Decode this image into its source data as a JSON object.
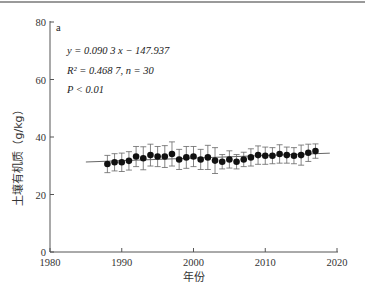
{
  "panel_label": "a",
  "annotations": {
    "equation": "y = 0.090 3 x − 147.937",
    "r2_line": "R² = 0.468 7, n = 30",
    "p_line": "P < 0.01"
  },
  "xlabel": "年份",
  "ylabel": "土壤有机质（g/kg）",
  "x_ticks": [
    "1980",
    "1990",
    "2000",
    "2010",
    "2020"
  ],
  "y_ticks": [
    "0",
    "20",
    "40",
    "60",
    "80"
  ],
  "chart_data": {
    "type": "scatter",
    "title": "",
    "panel": "a",
    "xlabel": "年份",
    "ylabel": "土壤有机质（g/kg）",
    "xlim": [
      1980,
      2020
    ],
    "ylim": [
      0,
      80
    ],
    "x_ticks": [
      1980,
      1990,
      2000,
      2010,
      2020
    ],
    "y_ticks": [
      0,
      20,
      40,
      60,
      80
    ],
    "grid": false,
    "legend": null,
    "series": [
      {
        "name": "土壤有机质",
        "marker": "filled-circle",
        "x": [
          1988,
          1989,
          1990,
          1991,
          1992,
          1993,
          1994,
          1995,
          1996,
          1997,
          1998,
          1999,
          2000,
          2001,
          2002,
          2003,
          2004,
          2005,
          2006,
          2007,
          2008,
          2009,
          2010,
          2011,
          2012,
          2013,
          2014,
          2015,
          2016,
          2017
        ],
        "y": [
          30.6,
          31.2,
          31.2,
          31.7,
          33.2,
          32.6,
          33.7,
          33.2,
          33.2,
          34.1,
          32.2,
          32.9,
          33.2,
          32.2,
          32.9,
          31.8,
          31.4,
          32.2,
          31.4,
          32.2,
          32.9,
          33.7,
          33.5,
          33.5,
          34.1,
          33.7,
          33.5,
          33.7,
          34.5,
          35.1
        ],
        "error": [
          3.0,
          3.0,
          3.2,
          3.2,
          3.5,
          4.0,
          3.8,
          3.5,
          3.8,
          4.2,
          3.5,
          3.8,
          3.5,
          3.5,
          4.2,
          4.5,
          2.5,
          3.0,
          2.5,
          2.5,
          3.0,
          3.2,
          3.0,
          2.8,
          3.2,
          2.8,
          2.8,
          3.5,
          3.0,
          2.5
        ]
      }
    ],
    "trendline": {
      "equation": "y = 0.0903x - 147.937",
      "slope": 0.0903,
      "intercept": -147.937,
      "x_range": [
        1985,
        2019
      ],
      "R2": 0.4687,
      "n": 30,
      "p": "< 0.01"
    },
    "annotations": [
      "a",
      "y = 0.090 3 x − 147.937",
      "R² = 0.468 7, n = 30",
      "P < 0.01"
    ]
  }
}
